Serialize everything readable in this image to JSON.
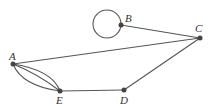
{
  "diagram": {
    "type": "graph",
    "nodes": [
      {
        "id": "A",
        "label": "A",
        "x": 13,
        "y": 64,
        "label_x": 9,
        "label_y": 58
      },
      {
        "id": "B",
        "label": "B",
        "x": 121,
        "y": 25,
        "label_x": 125,
        "label_y": 21
      },
      {
        "id": "C",
        "label": "C",
        "x": 200,
        "y": 38,
        "label_x": 195,
        "label_y": 32
      },
      {
        "id": "D",
        "label": "D",
        "x": 124,
        "y": 90,
        "label_x": 120,
        "label_y": 103
      },
      {
        "id": "E",
        "label": "E",
        "x": 60,
        "y": 91,
        "label_x": 56,
        "label_y": 103
      }
    ],
    "edges": [
      {
        "from": "A",
        "to": "C"
      },
      {
        "from": "B",
        "to": "C"
      },
      {
        "from": "C",
        "to": "D"
      },
      {
        "from": "D",
        "to": "E"
      },
      {
        "from": "A",
        "to": "E",
        "multiplicity": 3
      },
      {
        "from": "B",
        "to": "B",
        "type": "loop"
      }
    ],
    "colors": {
      "edge": "#555555",
      "node": "#444444",
      "label": "#333333"
    }
  }
}
